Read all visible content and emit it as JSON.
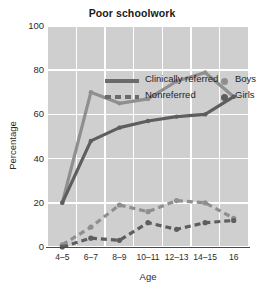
{
  "chart_data": {
    "type": "line",
    "title": "Poor schoolwork",
    "xlabel": "Age",
    "ylabel": "Percentage",
    "categories": [
      "4–5",
      "6–7",
      "8–9",
      "10–11",
      "12–13",
      "14–15",
      "16"
    ],
    "ylim": [
      0,
      100
    ],
    "yticks": [
      0,
      20,
      40,
      60,
      80,
      100
    ],
    "ytick_labels": [
      "0",
      "20",
      "40",
      "60",
      "80",
      "100"
    ],
    "grid": true,
    "legend_position": "upper-left-inside",
    "series": [
      {
        "name": "Clinically referred Boys",
        "group": "Clinically referred",
        "subject": "Boys",
        "style": "solid",
        "color": "#8f8f8f",
        "values": [
          20,
          70,
          65,
          67,
          75,
          79,
          68
        ]
      },
      {
        "name": "Clinically referred Girls",
        "group": "Clinically referred",
        "subject": "Girls",
        "style": "solid",
        "color": "#5e5e5e",
        "values": [
          20,
          48,
          54,
          57,
          59,
          60,
          68
        ]
      },
      {
        "name": "Nonreferred Boys",
        "group": "Nonreferred",
        "subject": "Boys",
        "style": "dashed",
        "color": "#8f8f8f",
        "values": [
          1,
          9,
          19,
          16,
          21,
          20,
          13
        ]
      },
      {
        "name": "Nonreferred Girls",
        "group": "Nonreferred",
        "subject": "Girls",
        "style": "dashed",
        "color": "#5e5e5e",
        "values": [
          0,
          4,
          3,
          11,
          8,
          11,
          12
        ]
      }
    ],
    "legend": {
      "line_entries": [
        {
          "label": "Clinically referred",
          "style": "solid"
        },
        {
          "label": "Nonreferred",
          "style": "dashed"
        }
      ],
      "marker_entries": [
        {
          "label": "Boys",
          "color": "#8f8f8f"
        },
        {
          "label": "Girls",
          "color": "#5e5e5e"
        }
      ]
    },
    "colors": {
      "plot_background": "#cfcfcf",
      "gridline": "#ffffff",
      "boys": "#8f8f8f",
      "girls": "#5e5e5e",
      "axis": "#4a4a4a",
      "text": "#1f1f1f"
    }
  }
}
